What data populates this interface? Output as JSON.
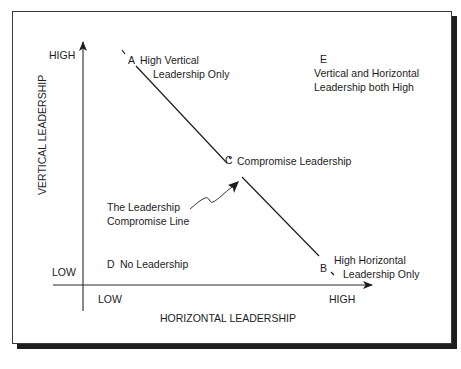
{
  "figure": {
    "axes": {
      "vertical": {
        "title": "VERTICAL LEADERSHIP",
        "high": "HIGH",
        "low": "LOW"
      },
      "horizontal": {
        "title": "HORIZONTAL LEADERSHIP",
        "high": "HIGH",
        "low": "LOW"
      }
    },
    "points": {
      "A": {
        "letter": "A",
        "line1": "High Vertical",
        "line2": "Leadership Only"
      },
      "B": {
        "letter": "B",
        "line1": "High Horizontal",
        "line2": "Leadership Only"
      },
      "C": {
        "letter": "C",
        "label": "Compromise Leadership"
      },
      "D": {
        "letter": "D",
        "label": "No Leadership"
      },
      "E": {
        "letter": "E",
        "line1": "Vertical and Horizontal",
        "line2": "Leadership both High"
      }
    },
    "annotation": {
      "line1": "The Leadership",
      "line2": "Compromise Line"
    },
    "caption": ""
  },
  "colors": {
    "ink": "#1d1d1d",
    "frame": "#3a3a3a",
    "shadow": "#1e1e1e",
    "background": "#ffffff"
  }
}
